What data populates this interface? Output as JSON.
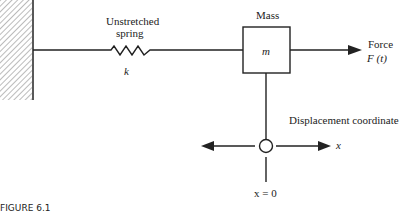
{
  "labels": {
    "spring_line1": "Unstretched",
    "spring_line2": "spring",
    "spring_constant": "k",
    "mass_title": "Mass",
    "mass_symbol": "m",
    "force_line1": "Force",
    "force_line2": "F (t)",
    "displacement": "Displacement coordinate",
    "axis_symbol": "x",
    "origin": "x = 0"
  },
  "caption": "FIGURE 6.1",
  "colors": {
    "ink": "#222222",
    "background": "#ffffff"
  }
}
